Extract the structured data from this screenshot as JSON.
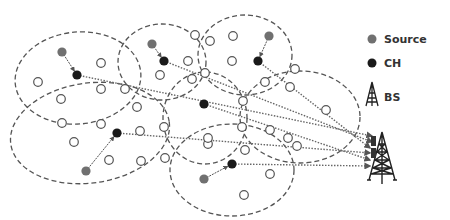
{
  "legend": {
    "source": "Source",
    "ch": "CH",
    "bs": "BS"
  },
  "colors": {
    "source": "#707070",
    "ch": "#1a1a1a",
    "node_stroke": "#555555",
    "cluster_stroke": "#555555",
    "link": "#666666"
  },
  "clusters": [
    {
      "cx": 78,
      "cy": 78,
      "rx": 63,
      "ry": 46,
      "rot": -5
    },
    {
      "cx": 162,
      "cy": 62,
      "rx": 44,
      "ry": 38,
      "rot": 0
    },
    {
      "cx": 245,
      "cy": 55,
      "rx": 47,
      "ry": 40,
      "rot": 0
    },
    {
      "cx": 90,
      "cy": 133,
      "rx": 80,
      "ry": 50,
      "rot": -8
    },
    {
      "cx": 205,
      "cy": 118,
      "rx": 42,
      "ry": 46,
      "rot": 0
    },
    {
      "cx": 300,
      "cy": 117,
      "rx": 60,
      "ry": 46,
      "rot": 0
    },
    {
      "cx": 232,
      "cy": 170,
      "rx": 62,
      "ry": 46,
      "rot": 0
    }
  ],
  "sources": [
    {
      "x": 62,
      "y": 52
    },
    {
      "x": 152,
      "y": 44
    },
    {
      "x": 269,
      "y": 36
    },
    {
      "x": 86,
      "y": 171
    },
    {
      "x": 204,
      "y": 179
    }
  ],
  "cluster_heads": [
    {
      "x": 77,
      "y": 75
    },
    {
      "x": 164,
      "y": 61
    },
    {
      "x": 258,
      "y": 61
    },
    {
      "x": 117,
      "y": 133
    },
    {
      "x": 204,
      "y": 104
    },
    {
      "x": 232,
      "y": 164
    }
  ],
  "normal_nodes": [
    {
      "x": 38,
      "y": 82
    },
    {
      "x": 101,
      "y": 63
    },
    {
      "x": 101,
      "y": 89
    },
    {
      "x": 125,
      "y": 89
    },
    {
      "x": 61,
      "y": 99
    },
    {
      "x": 137,
      "y": 107
    },
    {
      "x": 195,
      "y": 35
    },
    {
      "x": 233,
      "y": 36
    },
    {
      "x": 188,
      "y": 61
    },
    {
      "x": 210,
      "y": 41
    },
    {
      "x": 232,
      "y": 61
    },
    {
      "x": 160,
      "y": 75
    },
    {
      "x": 192,
      "y": 79
    },
    {
      "x": 265,
      "y": 82
    },
    {
      "x": 290,
      "y": 87
    },
    {
      "x": 205,
      "y": 73
    },
    {
      "x": 295,
      "y": 69
    },
    {
      "x": 326,
      "y": 110
    },
    {
      "x": 242,
      "y": 127
    },
    {
      "x": 270,
      "y": 130
    },
    {
      "x": 288,
      "y": 138
    },
    {
      "x": 297,
      "y": 146
    },
    {
      "x": 208,
      "y": 144
    },
    {
      "x": 245,
      "y": 150
    },
    {
      "x": 62,
      "y": 123
    },
    {
      "x": 101,
      "y": 124
    },
    {
      "x": 74,
      "y": 142
    },
    {
      "x": 109,
      "y": 160
    },
    {
      "x": 140,
      "y": 131
    },
    {
      "x": 164,
      "y": 127
    },
    {
      "x": 165,
      "y": 158
    },
    {
      "x": 141,
      "y": 161
    },
    {
      "x": 208,
      "y": 138
    },
    {
      "x": 270,
      "y": 174
    },
    {
      "x": 244,
      "y": 195
    },
    {
      "x": 243,
      "y": 101
    }
  ],
  "bs": {
    "x": 382,
    "y": 160
  },
  "legend_pos": {
    "x": 380,
    "y": 38
  }
}
